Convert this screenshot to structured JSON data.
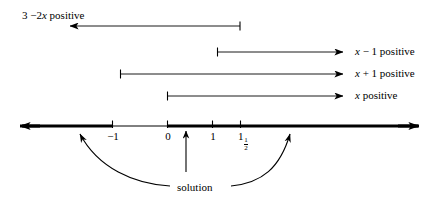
{
  "figure": {
    "type": "number-line-sign-diagram",
    "solution_label": "solution"
  },
  "intervals": [
    {
      "id": "three-minus-two-x",
      "label_prefix": "3 ",
      "label_minus": "−",
      "label_coef": "2",
      "label_var": "x",
      "label_suffix": " positive",
      "label_full": "3 − 2x positive",
      "direction": "left",
      "label_position": "left-above"
    },
    {
      "id": "x-minus-one",
      "label_prefix": "",
      "label_var": "x",
      "label_op": " − 1",
      "label_suffix": " positive",
      "label_full": "x − 1 positive",
      "direction": "right",
      "label_position": "right"
    },
    {
      "id": "x-plus-one",
      "label_prefix": "",
      "label_var": "x",
      "label_op": " + 1",
      "label_suffix": " positive",
      "label_full": "x + 1 positive",
      "direction": "right",
      "label_position": "right"
    },
    {
      "id": "x-positive",
      "label_prefix": "",
      "label_var": "x",
      "label_op": "",
      "label_suffix": " positive",
      "label_full": "x positive",
      "direction": "right",
      "label_position": "right"
    }
  ],
  "number_line": {
    "ticks": [
      {
        "id": "tick-minus-one",
        "label": "−1",
        "whole": "−1",
        "has_fraction": false
      },
      {
        "id": "tick-zero",
        "label": "0",
        "whole": "0",
        "has_fraction": false
      },
      {
        "id": "tick-one",
        "label": "1",
        "whole": "1",
        "has_fraction": false
      },
      {
        "id": "tick-one-and-half",
        "label": "1½",
        "whole": "1",
        "has_fraction": true,
        "numerator": "1",
        "denominator": "2"
      }
    ],
    "left_arrow": "←",
    "right_arrow": "→"
  },
  "colors": {
    "ink": "#000000",
    "background": "#ffffff"
  }
}
